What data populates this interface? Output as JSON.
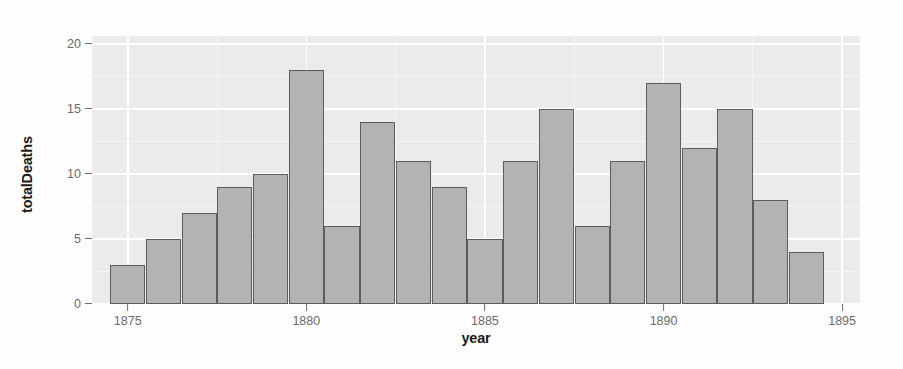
{
  "chart_data": {
    "type": "bar",
    "title": "",
    "subtitle": "",
    "xlabel": "year",
    "ylabel": "totalDeaths",
    "x": [
      1875,
      1876,
      1877,
      1878,
      1879,
      1880,
      1881,
      1882,
      1883,
      1884,
      1885,
      1886,
      1887,
      1888,
      1889,
      1890,
      1891,
      1892,
      1893,
      1894
    ],
    "categories": [
      "1875",
      "1876",
      "1877",
      "1878",
      "1879",
      "1880",
      "1881",
      "1882",
      "1883",
      "1884",
      "1885",
      "1886",
      "1887",
      "1888",
      "1889",
      "1890",
      "1891",
      "1892",
      "1893",
      "1894"
    ],
    "values": [
      3,
      5,
      7,
      9,
      10,
      18,
      6,
      14,
      11,
      9,
      5,
      11,
      15,
      6,
      11,
      17,
      12,
      15,
      8,
      4
    ],
    "series": [
      {
        "name": "totalDeaths",
        "values": [
          3,
          5,
          7,
          9,
          10,
          18,
          6,
          14,
          11,
          9,
          5,
          11,
          15,
          6,
          11,
          17,
          12,
          15,
          8,
          4
        ]
      }
    ],
    "xlim": [
      1874.0,
      1895.5
    ],
    "ylim": [
      0,
      20.6
    ],
    "x_ticks": [
      1875,
      1880,
      1885,
      1890,
      1895
    ],
    "x_tick_labels": [
      "1875",
      "1880",
      "1885",
      "1890",
      "1895"
    ],
    "y_ticks": [
      0,
      5,
      10,
      15,
      20
    ],
    "y_tick_labels": [
      "0",
      "5",
      "10",
      "15",
      "20"
    ],
    "y_minor_ticks": [
      2.5,
      7.5,
      12.5,
      17.5
    ],
    "x_minor_ticks": [
      1877.5,
      1882.5,
      1887.5,
      1892.5
    ],
    "grid": true,
    "legend": null,
    "legend_position": "none",
    "annotations": [],
    "colors": {
      "bar_fill": "#b3b3b3",
      "bar_border": "#5c5c5c",
      "panel_background": "#ebebeb",
      "grid_major": "#ffffff",
      "grid_minor": "#f6f6f6",
      "axis_text": "#6b6b6b",
      "axis_title": "#1a1a1a",
      "plot_background": "#fdfdfd"
    }
  }
}
